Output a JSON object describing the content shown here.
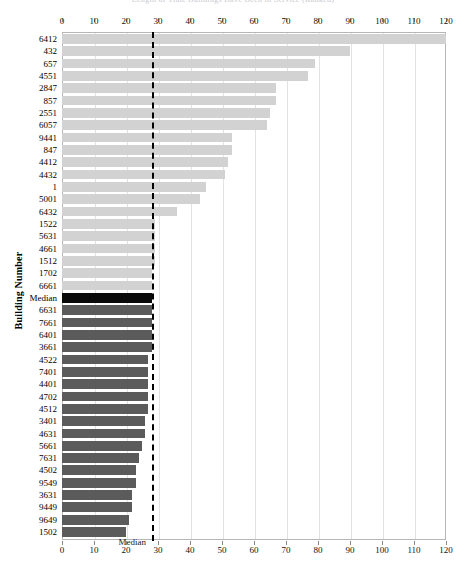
{
  "title": "Length of Time Buildings Have Been in Service (Ranked)",
  "axis": {
    "y_title": "Building Number",
    "x_ticks": [
      0,
      10,
      20,
      30,
      40,
      50,
      60,
      70,
      80,
      90,
      100,
      110,
      120
    ],
    "x_min": 0,
    "x_max": 120
  },
  "median": {
    "value": 28,
    "caption": "Median",
    "row_label": "Median"
  },
  "colors": {
    "light_bar": "#d2d2d2",
    "dark_bar": "#5b5b5b",
    "median_bar": "#0a0a0a",
    "grid": "#e2e2e2",
    "frame": "#b6b6b6",
    "median_line": "#000000"
  },
  "chart_data": {
    "type": "bar",
    "orientation": "horizontal",
    "title": "Length of Time Buildings Have Been in Service (Ranked)",
    "xlabel": "",
    "ylabel": "Building Number",
    "xlim": [
      0,
      120
    ],
    "xticks": [
      0,
      10,
      20,
      30,
      40,
      50,
      60,
      70,
      80,
      90,
      100,
      110,
      120
    ],
    "grid": true,
    "legend": null,
    "annotations": [
      {
        "text": "Median",
        "x": 28,
        "type": "reference-line-label"
      }
    ],
    "reference_lines": [
      {
        "value": 28,
        "style": "dashed",
        "label": "Median"
      }
    ],
    "categories": [
      "6412",
      "432",
      "657",
      "4551",
      "2847",
      "857",
      "2551",
      "6057",
      "9441",
      "847",
      "4412",
      "4432",
      "1",
      "5001",
      "6432",
      "1522",
      "5631",
      "4661",
      "1512",
      "1702",
      "6661",
      "Median",
      "6631",
      "7661",
      "6401",
      "3661",
      "4522",
      "7401",
      "4401",
      "4702",
      "4512",
      "3401",
      "4631",
      "5661",
      "7631",
      "4502",
      "9549",
      "3631",
      "9449",
      "9649",
      "1502"
    ],
    "values": [
      120,
      90,
      79,
      77,
      67,
      67,
      65,
      64,
      53,
      53,
      52,
      51,
      45,
      43,
      36,
      29,
      29,
      29,
      29,
      28,
      28,
      28,
      28,
      28,
      28,
      28,
      27,
      27,
      27,
      27,
      27,
      26,
      26,
      25,
      24,
      23,
      23,
      22,
      22,
      21,
      20
    ],
    "bar_groups": [
      {
        "name": "above-or-at-median",
        "color": "#d2d2d2",
        "indices_from": 0,
        "indices_to": 20
      },
      {
        "name": "median",
        "color": "#0a0a0a",
        "indices_from": 21,
        "indices_to": 21
      },
      {
        "name": "below-median",
        "color": "#5b5b5b",
        "indices_from": 22,
        "indices_to": 40
      }
    ]
  }
}
